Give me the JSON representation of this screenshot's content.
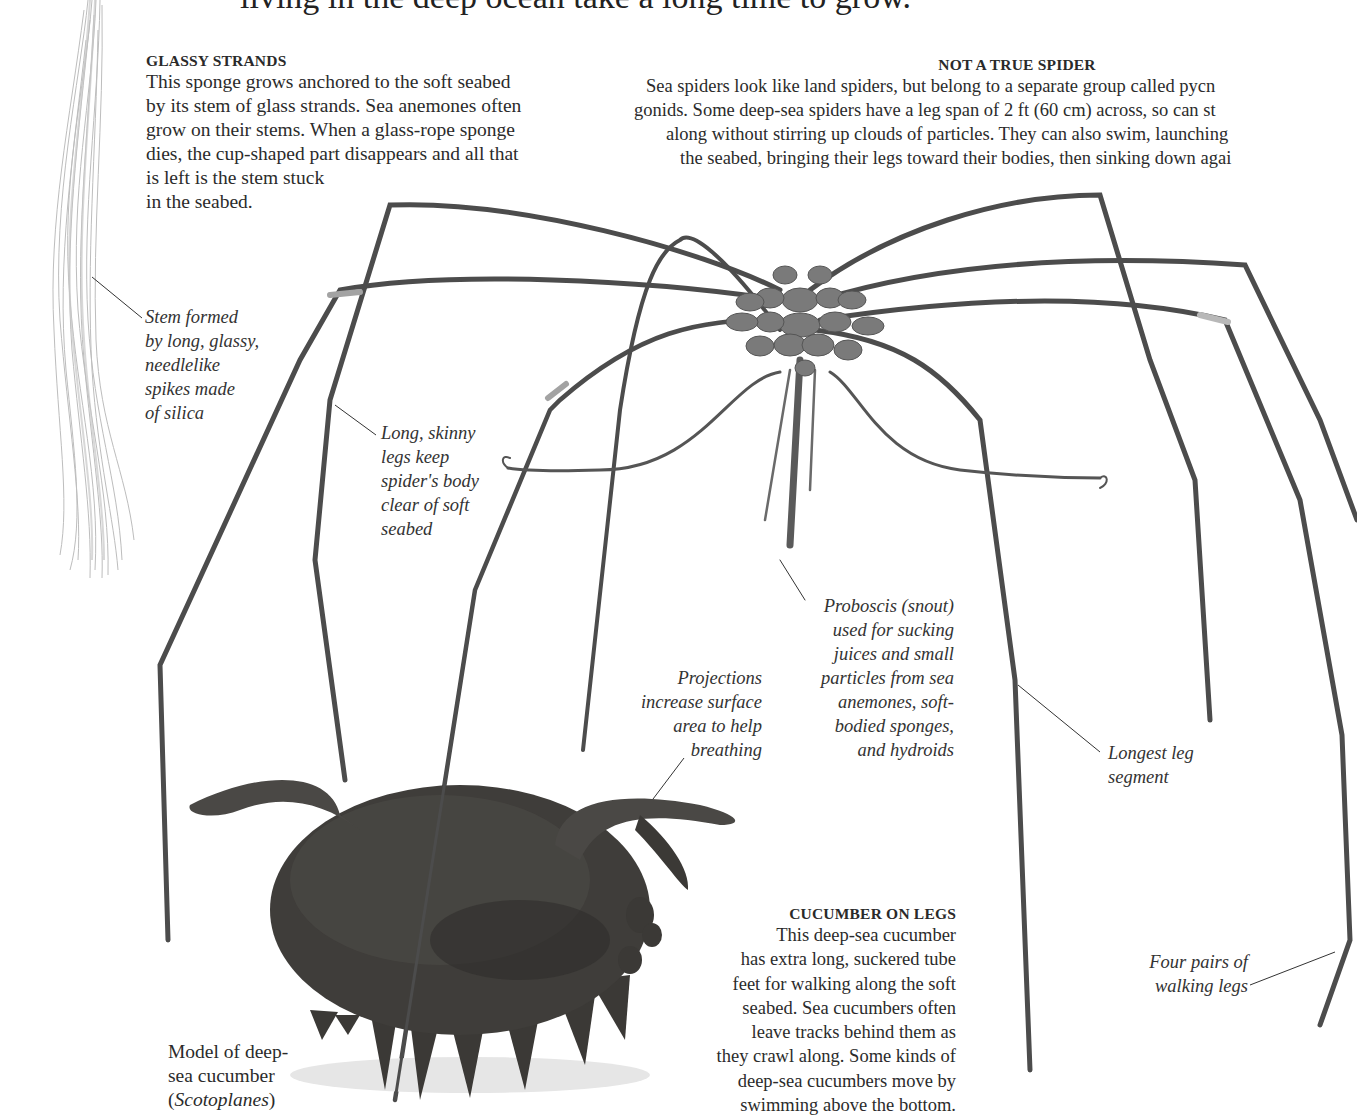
{
  "page": {
    "headline_fragment": "living in the deep ocean take a long time to grow."
  },
  "glassy_strands": {
    "heading": "GLASSY STRANDS",
    "lines": [
      "This sponge grows anchored to the soft seabed",
      "by its stem of glass strands. Sea anemones often",
      "grow on their stems. When a glass-rope sponge",
      "dies, the cup-shaped part disappears and all that",
      "is left is the stem stuck",
      "in the seabed."
    ]
  },
  "not_a_true_spider": {
    "heading": "NOT A TRUE SPIDER",
    "lines": [
      "Sea spiders look like land spiders, but belong to a separate group called pycn",
      "gonids. Some deep-sea spiders have a leg span of 2 ft (60 cm) across, so can st",
      "along without stirring up clouds of particles. They can also swim, launching",
      "the seabed, bringing their legs toward their bodies, then sinking down agai"
    ]
  },
  "cucumber_on_legs": {
    "heading": "CUCUMBER ON LEGS",
    "lines": [
      "This deep-sea cucumber",
      "has extra long, suckered tube",
      "feet for walking along the soft",
      "seabed. Sea cucumbers often",
      "leave tracks behind them as",
      "they crawl along. Some kinds of",
      "deep-sea cucumbers move by",
      "swimming above the bottom."
    ]
  },
  "captions": {
    "stem": [
      "Stem formed",
      "by long, glassy,",
      "needlelike",
      "spikes made",
      "of silica"
    ],
    "skinny_legs": [
      "Long, skinny",
      "legs keep",
      "spider's body",
      "clear of soft",
      "seabed"
    ],
    "proboscis": [
      "Proboscis (snout)",
      "used for sucking",
      "juices and small",
      "particles from sea",
      "anemones, soft-",
      "bodied sponges,",
      "and hydroids"
    ],
    "projections": [
      "Projections",
      "increase surface",
      "area to help",
      "breathing"
    ],
    "longest_leg": [
      "Longest leg",
      "segment"
    ],
    "four_pairs": [
      "Four pairs of",
      "walking legs"
    ],
    "model": {
      "line1": "Model of deep-",
      "line2": "sea cucumber",
      "species_open": "(",
      "species": "Scotoplanes",
      "species_close": ")"
    }
  },
  "images": {
    "sponge_stem": "glass-rope-sponge-stem",
    "sea_spider": "sea-spider-pycnogonid",
    "sea_cucumber": "sea-cucumber-model-scotoplanes"
  },
  "colors": {
    "text": "#2b2b2b",
    "spider_leg": "#4a4a4a",
    "spider_body": "#6e6e6e",
    "cucumber": "#3a3836",
    "sponge": "#b8b8b8"
  }
}
